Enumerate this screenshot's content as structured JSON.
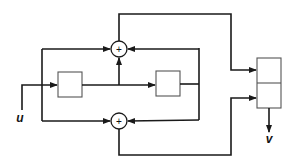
{
  "diagram": {
    "type": "block-diagram",
    "input_label": "u",
    "output_label": "v",
    "summing_junctions": [
      {
        "id": "sum-top",
        "symbol": "+"
      },
      {
        "id": "sum-bottom",
        "symbol": "+"
      }
    ],
    "blocks": [
      {
        "id": "block-left",
        "label": ""
      },
      {
        "id": "block-right",
        "label": ""
      },
      {
        "id": "output-register-top",
        "label": ""
      },
      {
        "id": "output-register-bottom",
        "label": ""
      }
    ],
    "colors": {
      "line": "#1a1a1a",
      "box": "#555555",
      "background": "#ffffff"
    }
  }
}
